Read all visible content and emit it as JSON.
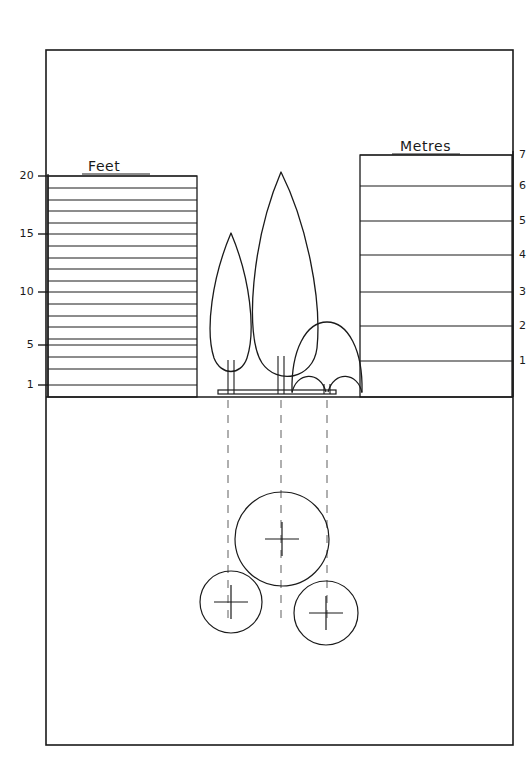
{
  "drawing": {
    "title_feet": "Feet",
    "title_metres": "Metres",
    "ink_color": "#1a1a1a",
    "background_color": "#ffffff",
    "dash_color": "#6e6e6e",
    "frame": {
      "x": 46,
      "y": 50,
      "width": 467,
      "height": 695
    },
    "ground_line_y": 397
  },
  "feet_scale": {
    "label": "Feet",
    "box": {
      "x": 48,
      "y": 176,
      "width": 149,
      "height": 221
    },
    "unit_label": "Feet",
    "min": 1,
    "max": 20,
    "tick_labels": [
      "20",
      "15",
      "10",
      "5",
      "1"
    ],
    "tick_values": [
      20,
      15,
      10,
      5,
      1
    ],
    "tick_y": [
      176,
      234,
      292,
      345,
      385
    ],
    "bar_count": 19,
    "bars": [
      {
        "value": 20,
        "y": 176,
        "labeled": true,
        "label": "20"
      },
      {
        "value": 19,
        "y": 188,
        "labeled": false,
        "label": ""
      },
      {
        "value": 18,
        "y": 200,
        "labeled": false,
        "label": ""
      },
      {
        "value": 17,
        "y": 211,
        "labeled": false,
        "label": ""
      },
      {
        "value": 16,
        "y": 223,
        "labeled": false,
        "label": ""
      },
      {
        "value": 15,
        "y": 234,
        "labeled": true,
        "label": "15"
      },
      {
        "value": 14,
        "y": 246,
        "labeled": false,
        "label": ""
      },
      {
        "value": 13,
        "y": 258,
        "labeled": false,
        "label": ""
      },
      {
        "value": 12,
        "y": 269,
        "labeled": false,
        "label": ""
      },
      {
        "value": 11,
        "y": 281,
        "labeled": false,
        "label": ""
      },
      {
        "value": 10,
        "y": 292,
        "labeled": true,
        "label": "10"
      },
      {
        "value": 9,
        "y": 304,
        "labeled": false,
        "label": ""
      },
      {
        "value": 8,
        "y": 316,
        "labeled": false,
        "label": ""
      },
      {
        "value": 7,
        "y": 327,
        "labeled": false,
        "label": ""
      },
      {
        "value": 6,
        "y": 339,
        "labeled": false,
        "label": ""
      },
      {
        "value": 5,
        "y": 345,
        "labeled": true,
        "label": "5"
      },
      {
        "value": 4,
        "y": 357,
        "labeled": false,
        "label": ""
      },
      {
        "value": 3,
        "y": 369,
        "labeled": false,
        "label": ""
      },
      {
        "value": 1,
        "y": 385,
        "labeled": true,
        "label": "1"
      }
    ]
  },
  "metres_scale": {
    "label": "Metres",
    "box": {
      "x": 360,
      "y": 155,
      "width": 152,
      "height": 242
    },
    "unit_label": "Metres",
    "min": 1,
    "max": 7,
    "tick_labels": [
      "7",
      "6",
      "5",
      "4",
      "3",
      "2",
      "1"
    ],
    "tick_values": [
      7,
      6,
      5,
      4,
      3,
      2,
      1
    ],
    "tick_y": [
      155,
      186,
      221,
      255,
      292,
      326,
      361
    ]
  },
  "elevation": {
    "caption": "tree elevation",
    "base_platform": {
      "x1": 218,
      "x2": 336,
      "y": 394
    },
    "trees": [
      {
        "name": "small-conifer-left",
        "crown_apex_x": 231,
        "crown_apex_y": 233,
        "trunk_x": 231,
        "trunk_base_y": 394
      },
      {
        "name": "tall-conifer-centre",
        "crown_apex_x": 281,
        "crown_apex_y": 172,
        "trunk_x": 281,
        "trunk_base_y": 394
      },
      {
        "name": "dome-shrub-right",
        "crown_apex_x": 327,
        "crown_apex_y": 322,
        "trunk_x": 327,
        "trunk_base_y": 394
      }
    ]
  },
  "plan": {
    "caption": "tree plan canopy spread",
    "projection_lines_x": [
      228,
      281,
      327
    ],
    "projection_top_y": 400,
    "projection_bottom_y": 620,
    "circles": [
      {
        "name": "canopy-circle-centre",
        "cx": 282,
        "cy": 539,
        "r": 47,
        "marker": "cross"
      },
      {
        "name": "canopy-circle-left",
        "cx": 231,
        "cy": 602,
        "r": 31,
        "marker": "cross"
      },
      {
        "name": "canopy-circle-right",
        "cx": 326,
        "cy": 613,
        "r": 32,
        "marker": "cross"
      }
    ]
  }
}
